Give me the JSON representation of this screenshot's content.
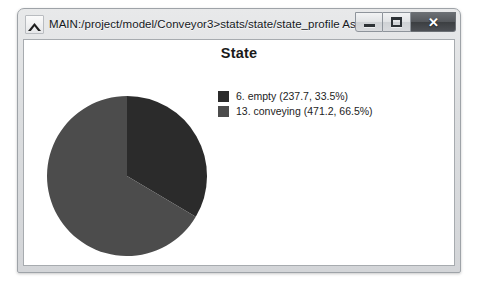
{
  "window": {
    "title": "MAIN:/project/model/Conveyor3>stats/state/state_profile As Graph",
    "app_icon": "peak-chart-icon",
    "controls": {
      "minimize_label": "–",
      "maximize_label": "□",
      "close_label": "✕"
    }
  },
  "chart_data": {
    "type": "pie",
    "title": "State",
    "xlabel": "",
    "ylabel": "",
    "legend_position": "right",
    "grid": false,
    "categories": [
      "6. empty",
      "13. conveying"
    ],
    "values": [
      237.7,
      471.2
    ],
    "percentages": [
      33.5,
      66.5
    ],
    "colors": [
      "#2b2b2b",
      "#4c4c4c"
    ],
    "total": 708.9,
    "start_angle_deg": 0,
    "direction": "clockwise",
    "legend_entries": [
      {
        "label": "6. empty (237.7, 33.5%)",
        "name": "6. empty",
        "value": 237.7,
        "percent": 33.5,
        "color": "#2b2b2b"
      },
      {
        "label": "13. conveying (471.2, 66.5%)",
        "name": "13. conveying",
        "value": 471.2,
        "percent": 66.5,
        "color": "#4c4c4c"
      }
    ]
  }
}
